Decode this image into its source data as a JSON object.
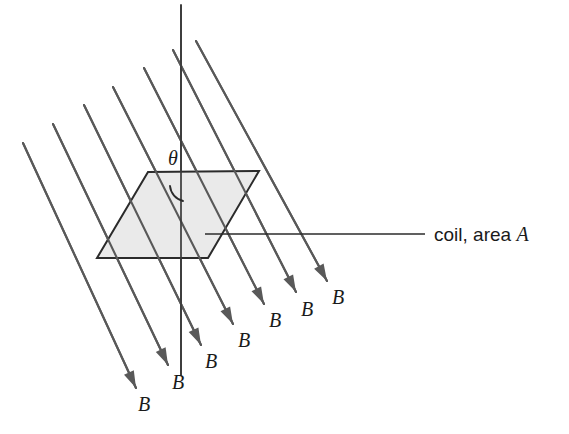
{
  "figure": {
    "background_color": "#ffffff",
    "width": 569,
    "height": 434
  },
  "coil": {
    "label": "coil, area ",
    "label_symbol": "A",
    "fill_color": "#eaeaea",
    "stroke_color": "#2b2b2b",
    "vertices": [
      [
        148,
        172
      ],
      [
        259,
        171
      ],
      [
        208,
        258
      ],
      [
        97,
        258
      ]
    ],
    "leader_line": {
      "x1": 205,
      "y1": 234,
      "x2": 425,
      "y2": 234
    },
    "label_x": 434,
    "label_y": 241
  },
  "normal_axis": {
    "name": "normal-to-coil-axis",
    "x1": 181,
    "y1": 5,
    "x2": 181,
    "y2": 375,
    "color": "#3a3a3a"
  },
  "angle": {
    "symbol": "θ",
    "label_x": 168,
    "label_y": 165,
    "arc_path": "M 170 186 A 17 17 0 0 0 183 201",
    "color": "#2b2b2b"
  },
  "field": {
    "symbol": "B",
    "color": "#595959",
    "direction": "down-right",
    "slope_dy_dx": 2.08,
    "lines": [
      {
        "x1": 23,
        "y1": 143,
        "x2": 136,
        "y2": 388,
        "label_x": 138,
        "label_y": 411,
        "arrow": true
      },
      {
        "x1": 53,
        "y1": 124,
        "x2": 168,
        "y2": 365,
        "label_x": 172,
        "label_y": 389,
        "arrow": true
      },
      {
        "x1": 84,
        "y1": 105,
        "x2": 201,
        "y2": 345,
        "label_x": 205,
        "label_y": 368,
        "arrow": true
      },
      {
        "x1": 113,
        "y1": 87,
        "x2": 233,
        "y2": 324,
        "label_x": 238,
        "label_y": 347,
        "arrow": true
      },
      {
        "x1": 144,
        "y1": 68,
        "x2": 264,
        "y2": 304,
        "label_x": 269,
        "label_y": 327,
        "arrow": true
      },
      {
        "x1": 173,
        "y1": 50,
        "x2": 296,
        "y2": 292,
        "label_x": 301,
        "label_y": 316,
        "arrow": true
      },
      {
        "x1": 196,
        "y1": 41,
        "x2": 327,
        "y2": 281,
        "label_x": 332,
        "label_y": 304,
        "arrow": true
      }
    ]
  },
  "chart_data": {
    "type": "diagram",
    "annotations": [
      "θ",
      "B",
      "coil, area A"
    ],
    "field_line_count": 7,
    "field_label": "B",
    "angle_label": "θ",
    "coil_label": "coil, area A"
  }
}
